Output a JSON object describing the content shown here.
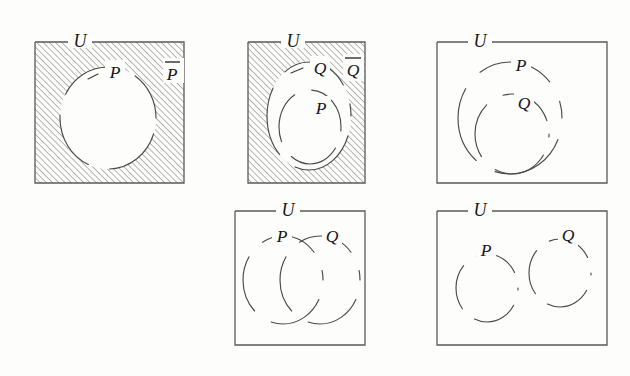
{
  "figure": {
    "background_color": "#fdfdfc",
    "ink_color": "#4a4a48",
    "hatch_color": "#8a8a88",
    "label_color": "#16161a"
  },
  "panels": [
    {
      "id": "panel-complement-p",
      "position": "top-left",
      "shaded": true,
      "shading_style": "diagonal-hatch-45",
      "shaded_region": "complement-of-P",
      "universe_label": "U",
      "labels": [
        {
          "name": "set-p-label",
          "text": "P",
          "overline": false
        },
        {
          "name": "complement-p-label",
          "text": "P",
          "overline": true
        }
      ],
      "sets": [
        "P"
      ],
      "relation": "complement"
    },
    {
      "id": "panel-complement-q-with-p-inside",
      "position": "top-middle",
      "shaded": true,
      "shading_style": "diagonal-hatch-45",
      "shaded_region": "complement-of-Q",
      "universe_label": "U",
      "labels": [
        {
          "name": "set-q-label",
          "text": "Q",
          "overline": false
        },
        {
          "name": "set-p-label",
          "text": "P",
          "overline": false
        },
        {
          "name": "complement-q-label",
          "text": "Q",
          "overline": true
        }
      ],
      "sets": [
        "Q",
        "P"
      ],
      "relation": "P-subset-of-Q"
    },
    {
      "id": "panel-q-subset-p",
      "position": "top-right",
      "shaded": false,
      "shading_style": "none",
      "shaded_region": "",
      "universe_label": "U",
      "labels": [
        {
          "name": "set-p-label",
          "text": "P",
          "overline": false
        },
        {
          "name": "set-q-label",
          "text": "Q",
          "overline": false
        }
      ],
      "sets": [
        "P",
        "Q"
      ],
      "relation": "Q-subset-of-P"
    },
    {
      "id": "panel-p-overlaps-q",
      "position": "bottom-middle",
      "shaded": false,
      "shading_style": "none",
      "shaded_region": "",
      "universe_label": "U",
      "labels": [
        {
          "name": "set-p-label",
          "text": "P",
          "overline": false
        },
        {
          "name": "set-q-label",
          "text": "Q",
          "overline": false
        }
      ],
      "sets": [
        "P",
        "Q"
      ],
      "relation": "P-intersects-Q"
    },
    {
      "id": "panel-p-disjoint-q",
      "position": "bottom-right",
      "shaded": false,
      "shading_style": "none",
      "shaded_region": "",
      "universe_label": "U",
      "labels": [
        {
          "name": "set-p-label",
          "text": "P",
          "overline": false
        },
        {
          "name": "set-q-label",
          "text": "Q",
          "overline": false
        }
      ],
      "sets": [
        "P",
        "Q"
      ],
      "relation": "P-disjoint-Q"
    }
  ],
  "text": {
    "universe": "U",
    "p": "P",
    "q": "Q"
  }
}
